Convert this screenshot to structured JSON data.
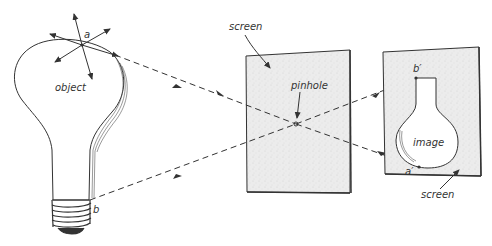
{
  "figure": {
    "labels": {
      "object": "object",
      "point_a": "a",
      "point_b": "b",
      "screen_1": "screen",
      "pinhole": "pinhole",
      "image": "image",
      "point_b_prime": "b′",
      "point_a_prime": "a′",
      "screen_2": "screen"
    },
    "colors": {
      "line": "#333333",
      "screen_fill": "#e9e9e9",
      "bulb_fill": "#ffffff"
    }
  }
}
